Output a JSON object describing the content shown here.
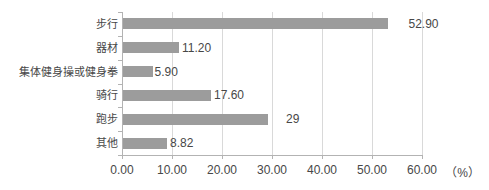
{
  "chart_data": {
    "type": "bar",
    "orientation": "horizontal",
    "title": "",
    "categories": [
      "步行",
      "器材",
      "集体健身操或健身拳",
      "骑行",
      "跑步",
      "其他"
    ],
    "values": [
      52.9,
      11.2,
      5.9,
      17.6,
      29,
      8.82
    ],
    "value_labels": [
      "52.90",
      "11.20",
      "5.90",
      "17.60",
      "29",
      "8.82"
    ],
    "x_tick_values": [
      0,
      10,
      20,
      30,
      40,
      50,
      60
    ],
    "x_tick_labels": [
      "0.00",
      "10.00",
      "20.00",
      "30.00",
      "40.00",
      "50.00",
      "60.00"
    ],
    "x_axis_unit": "（%）",
    "xlabel": "",
    "ylabel": "",
    "xlim": [
      0,
      60
    ],
    "grid": "vertical-gridlines-only",
    "legend": "none",
    "value_label_gaps_px": [
      21,
      3,
      2,
      3,
      18,
      3
    ],
    "colors": {
      "bar": "#9c9c9c",
      "gridline": "#d9d9d9",
      "axis": "#b3b3b3",
      "text": "#474747",
      "background": "#ffffff"
    }
  }
}
